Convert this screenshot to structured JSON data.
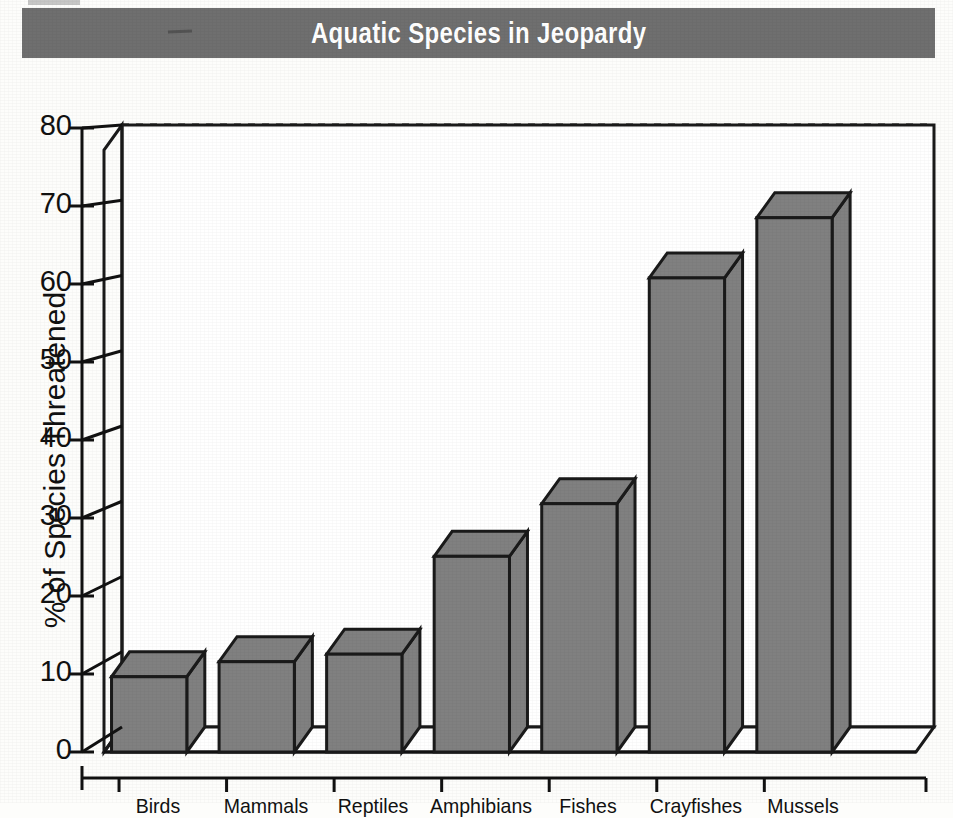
{
  "banner": {
    "title": "Aquatic Species in Jeopardy",
    "background_color": "#6f6f6f",
    "text_color": "#ffffff"
  },
  "chart_data": {
    "type": "bar",
    "title": "Aquatic Species in Jeopardy",
    "xlabel": "",
    "ylabel": "% of Species Threatened",
    "categories": [
      "Birds",
      "Mammals",
      "Reptiles",
      "Amphibians",
      "Fishes",
      "Crayfishes",
      "Mussels"
    ],
    "values": [
      10,
      12,
      13,
      26,
      33,
      63,
      71
    ],
    "ylim": [
      0,
      80
    ],
    "ytick_labels": [
      "0",
      "10",
      "20",
      "30",
      "40",
      "50",
      "60",
      "70",
      "80"
    ],
    "ytick_values": [
      0,
      10,
      20,
      30,
      40,
      50,
      60,
      70,
      80
    ],
    "grid": "horizontal-dashed",
    "legend": "none",
    "style": "3d-bars",
    "bar_fill_color": "#808080",
    "bar_edge_color": "#1a1a1a",
    "plot_background_color": "#ffffff"
  }
}
